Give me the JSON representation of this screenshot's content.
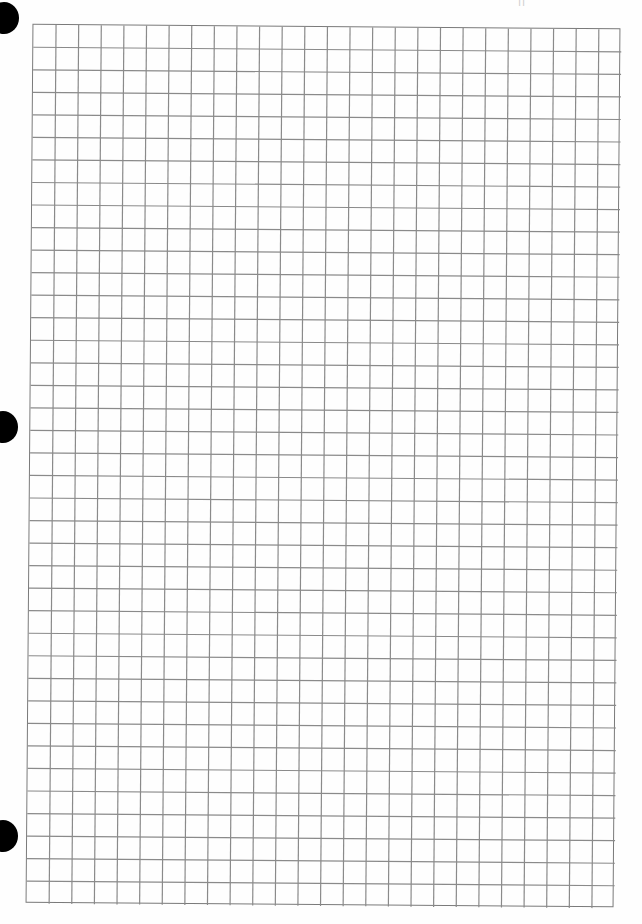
{
  "page": {
    "type": "scanned graph paper sheet",
    "background": "#ffffff",
    "line_color": "#8a8a8a"
  },
  "grid": {
    "columns": 26,
    "rows": 39,
    "cell_size_px": 22.6,
    "rotation_deg": 0.45
  },
  "holes": [
    {
      "name": "top",
      "cx": 4,
      "cy": 18
    },
    {
      "name": "middle",
      "cx": 3,
      "cy": 427
    },
    {
      "name": "bottom",
      "cx": 3,
      "cy": 836
    }
  ],
  "top_mark": {
    "text": "ıı"
  }
}
